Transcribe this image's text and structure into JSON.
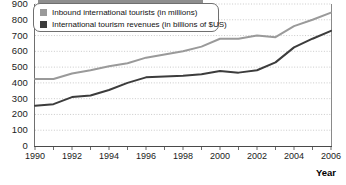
{
  "chart_data": {
    "type": "line",
    "title": "",
    "xlabel": "Year",
    "ylabel": "",
    "xlim": [
      1990,
      2006
    ],
    "ylim": [
      0,
      900
    ],
    "grid": true,
    "legend_position": "top-left",
    "x": [
      1990,
      1991,
      1992,
      1993,
      1994,
      1995,
      1996,
      1997,
      1998,
      1999,
      2000,
      2001,
      2002,
      2003,
      2004,
      2005,
      2006
    ],
    "x_tick_labels": [
      "1990",
      "1992",
      "1994",
      "1996",
      "1998",
      "2000",
      "2002",
      "2004",
      "2006"
    ],
    "y_tick_labels": [
      "0",
      "100",
      "200",
      "300",
      "400",
      "500",
      "600",
      "700",
      "800",
      "900"
    ],
    "series": [
      {
        "name": "Inbound international tourists (in millions)",
        "color": "#9a9a9a",
        "values": [
          425,
          425,
          460,
          480,
          505,
          525,
          560,
          580,
          600,
          630,
          680,
          680,
          700,
          690,
          760,
          800,
          845
        ]
      },
      {
        "name": "International tourism revenues (in billions of $US)",
        "color": "#3c3c3c",
        "values": [
          255,
          265,
          310,
          320,
          355,
          400,
          435,
          440,
          445,
          455,
          475,
          465,
          480,
          530,
          625,
          680,
          730
        ]
      }
    ]
  },
  "legend": {
    "items": [
      {
        "label": "Inbound international tourists (in millions)",
        "color": "#9a9a9a"
      },
      {
        "label": "International tourism revenues (in billions of $US)",
        "color": "#3c3c3c"
      }
    ]
  },
  "axes": {
    "x_title": "Year",
    "y_ticks": [
      "900",
      "800",
      "700",
      "600",
      "500",
      "400",
      "300",
      "200",
      "100",
      "0"
    ],
    "x_ticks": [
      "1990",
      "1992",
      "1994",
      "1996",
      "1998",
      "2000",
      "2002",
      "2004",
      "2006"
    ]
  }
}
